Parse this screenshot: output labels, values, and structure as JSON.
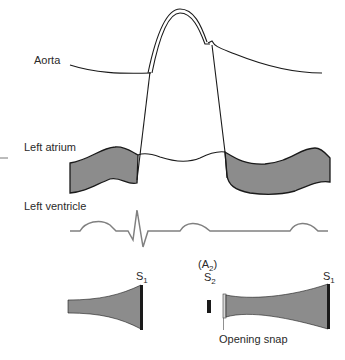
{
  "labels": {
    "aorta": "Aorta",
    "left_atrium": "Left atrium",
    "left_ventricle": "Left ventricle",
    "opening_snap": "Opening snap"
  },
  "sounds": {
    "s1_left": {
      "base": "S",
      "sub": "1"
    },
    "a2": {
      "open": "(A",
      "sub": "2",
      "close": ")"
    },
    "s2": {
      "base": "S",
      "sub": "2"
    },
    "s1_right": {
      "base": "S",
      "sub": "1"
    }
  },
  "colors": {
    "line": "#1a1a1a",
    "fill": "#8c8c8c",
    "ecg": "#808080",
    "bar": "#1a1a1a"
  }
}
